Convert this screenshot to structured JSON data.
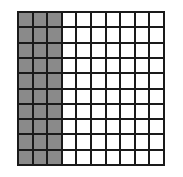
{
  "diagram": {
    "type": "hundred-grid",
    "rows": 10,
    "columns": 10,
    "shaded_columns": 3,
    "shaded_cells": 30,
    "total_cells": 100,
    "colors": {
      "shaded": "#8a8a8a",
      "unshaded": "#ffffff",
      "lines": "#1a1a1a"
    }
  }
}
